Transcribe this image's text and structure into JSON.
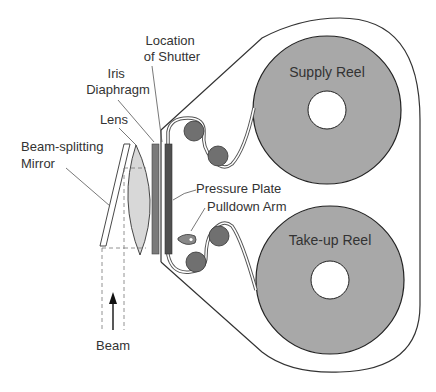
{
  "diagram": {
    "labels": {
      "shutter": [
        "Location",
        "of Shutter"
      ],
      "iris": [
        "Iris",
        "Diaphragm"
      ],
      "lens": "Lens",
      "mirror": [
        "Beam-splitting",
        "Mirror"
      ],
      "pressure_plate": "Pressure Plate",
      "pulldown_arm": "Pulldown Arm",
      "beam": "Beam",
      "supply_reel": "Supply Reel",
      "takeup_reel": "Take-up Reel"
    },
    "colors": {
      "reel_fill": "#a8a8a8",
      "roller_fill": "#707070",
      "iris_bar": "#7a7a7a",
      "pressure_bar": "#505050",
      "lens_fill": "#d8d8d8",
      "outline": "#333333"
    }
  }
}
